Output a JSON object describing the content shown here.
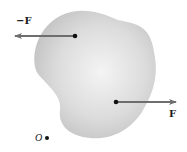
{
  "diagram": {
    "body": {
      "fill_center": "#f2f2f2",
      "fill_edge": "#c4c4c4"
    },
    "forces": [
      {
        "label": "−F",
        "direction": "left",
        "color": "#6e6e6e"
      },
      {
        "label": "F",
        "direction": "right",
        "color": "#6e6e6e"
      }
    ],
    "point": {
      "label": "O"
    }
  }
}
